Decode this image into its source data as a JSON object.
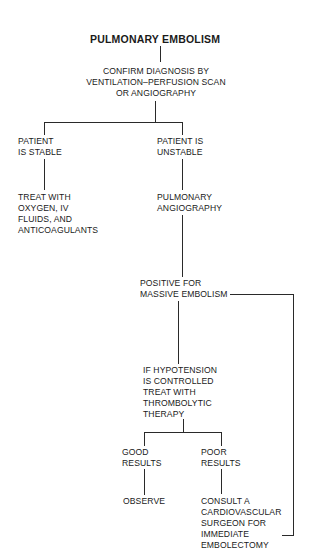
{
  "diagram": {
    "title": "PULMONARY EMBOLISM",
    "nodes": {
      "confirm": "CONFIRM DIAGNOSIS BY\nVENTILATION–PERFUSION SCAN\nOR ANGIOGRAPHY",
      "stable": "PATIENT\nIS STABLE",
      "unstable": "PATIENT IS\nUNSTABLE",
      "treat_stable": "TREAT WITH\nOXYGEN, IV\nFLUIDS, AND\nANTICOAGULANTS",
      "pulmonary_angiography": "PULMONARY\nANGIOGRAPHY",
      "positive": "POSITIVE FOR\nMASSIVE EMBOLISM",
      "thrombolytic": "IF HYPOTENSION\nIS CONTROLLED\nTREAT WITH\nTHROMBOLYTIC\nTHERAPY",
      "good_results": "GOOD\nRESULTS",
      "poor_results": "POOR\nRESULTS",
      "observe": "OBSERVE",
      "consult": "CONSULT A\nCARDIOVASCULAR\nSURGEON FOR\nIMMEDIATE\nEMBOLECTOMY"
    },
    "edges": [
      {
        "from": "title",
        "to": "confirm"
      },
      {
        "from": "confirm",
        "to": "stable"
      },
      {
        "from": "confirm",
        "to": "unstable"
      },
      {
        "from": "stable",
        "to": "treat_stable"
      },
      {
        "from": "unstable",
        "to": "pulmonary_angiography"
      },
      {
        "from": "pulmonary_angiography",
        "to": "positive"
      },
      {
        "from": "positive",
        "to": "thrombolytic"
      },
      {
        "from": "positive",
        "to": "consult"
      },
      {
        "from": "thrombolytic",
        "to": "good_results"
      },
      {
        "from": "thrombolytic",
        "to": "poor_results"
      },
      {
        "from": "good_results",
        "to": "observe"
      },
      {
        "from": "poor_results",
        "to": "consult"
      }
    ],
    "colors": {
      "line": "#2a2a2a",
      "text": "#1a1a1a",
      "background": "#ffffff"
    }
  }
}
